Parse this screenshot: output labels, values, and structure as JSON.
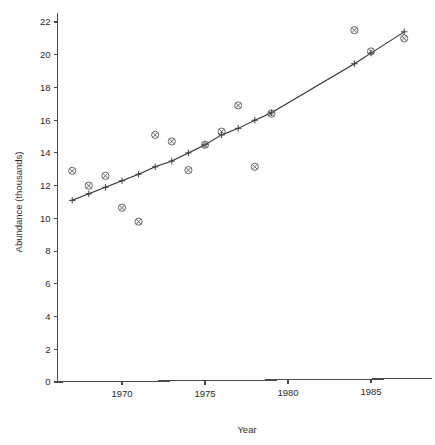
{
  "chart_data": {
    "type": "scatter",
    "title": "",
    "xlabel": "Year",
    "ylabel": "Abundance (thousands)",
    "xlim": [
      1966.4,
      1987.6
    ],
    "ylim": [
      0,
      22.6
    ],
    "xticks": [
      1970,
      1975,
      1980,
      1985
    ],
    "xtick_labels": [
      "1970",
      "1975",
      "1980",
      "1985"
    ],
    "yticks": [
      0,
      2,
      4,
      6,
      8,
      10,
      12,
      14,
      16,
      18,
      20,
      22
    ],
    "ytick_labels": [
      "0",
      "2",
      "4",
      "6",
      "8",
      "10",
      "12",
      "14",
      "16",
      "18",
      "20",
      "22"
    ],
    "grid": false,
    "legend": "none",
    "x": [
      1967,
      1968,
      1969,
      1970,
      1971,
      1972,
      1973,
      1974,
      1975,
      1976,
      1977,
      1978,
      1979,
      1984,
      1985,
      1987
    ],
    "observed": [
      12.9,
      12.0,
      12.6,
      10.65,
      9.8,
      15.1,
      14.7,
      12.95,
      14.5,
      15.3,
      16.9,
      13.15,
      16.4,
      21.5,
      20.2,
      21.0
    ],
    "series": [
      {
        "name": "observed",
        "marker": "circled-cross",
        "points": [
          {
            "x": 1967,
            "y": 12.9
          },
          {
            "x": 1968,
            "y": 12.0
          },
          {
            "x": 1969,
            "y": 12.6
          },
          {
            "x": 1970,
            "y": 10.65
          },
          {
            "x": 1971,
            "y": 9.8
          },
          {
            "x": 1972,
            "y": 15.1
          },
          {
            "x": 1973,
            "y": 14.7
          },
          {
            "x": 1974,
            "y": 12.95
          },
          {
            "x": 1975,
            "y": 14.5
          },
          {
            "x": 1976,
            "y": 15.3
          },
          {
            "x": 1977,
            "y": 16.9
          },
          {
            "x": 1978,
            "y": 13.15
          },
          {
            "x": 1979,
            "y": 16.4
          },
          {
            "x": 1984,
            "y": 21.5
          },
          {
            "x": 1985,
            "y": 20.2
          },
          {
            "x": 1987,
            "y": 21.0
          }
        ]
      },
      {
        "name": "fitted",
        "marker": "plus",
        "line": true,
        "points": [
          {
            "x": 1967,
            "y": 11.1
          },
          {
            "x": 1968,
            "y": 11.5
          },
          {
            "x": 1969,
            "y": 11.9
          },
          {
            "x": 1970,
            "y": 12.3
          },
          {
            "x": 1971,
            "y": 12.7
          },
          {
            "x": 1972,
            "y": 13.15
          },
          {
            "x": 1973,
            "y": 13.5
          },
          {
            "x": 1974,
            "y": 14.0
          },
          {
            "x": 1975,
            "y": 14.5
          },
          {
            "x": 1976,
            "y": 15.1
          },
          {
            "x": 1977,
            "y": 15.5
          },
          {
            "x": 1978,
            "y": 16.0
          },
          {
            "x": 1979,
            "y": 16.45
          },
          {
            "x": 1984,
            "y": 19.45
          },
          {
            "x": 1985,
            "y": 20.1
          },
          {
            "x": 1987,
            "y": 21.4
          }
        ]
      }
    ]
  }
}
